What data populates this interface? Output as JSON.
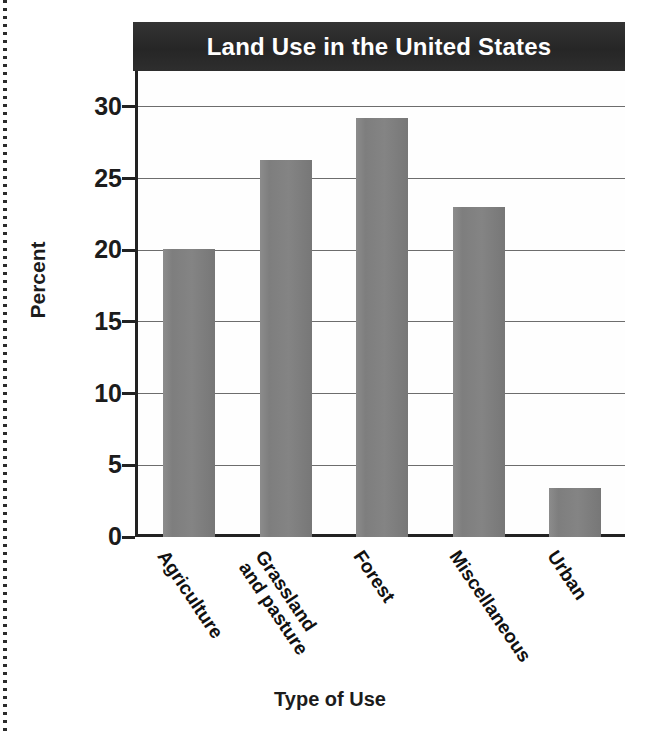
{
  "chart_data": {
    "type": "bar",
    "title": "Land Use in the United States",
    "xlabel": "Type of Use",
    "ylabel": "Percent",
    "categories": [
      "Agriculture",
      "Grassland and pasture",
      "Forest",
      "Miscellaneous",
      "Urban"
    ],
    "category_lines": [
      [
        "Agriculture"
      ],
      [
        "Grassland",
        "and pasture"
      ],
      [
        "Forest"
      ],
      [
        "Miscellaneous"
      ],
      [
        "Urban"
      ]
    ],
    "values": [
      20.1,
      26.3,
      29.2,
      23.0,
      3.4
    ],
    "ylim": [
      0,
      32.5
    ],
    "yticks": [
      0,
      5,
      10,
      15,
      20,
      25,
      30
    ],
    "ytick_labels": [
      "0",
      "5",
      "10",
      "15",
      "20",
      "25",
      "30"
    ],
    "grid": true,
    "legend": false,
    "bar_color": "#808080",
    "title_bar_color": "#2a2a2a",
    "title_text_color": "#ffffff",
    "axis_color": "#222222"
  }
}
